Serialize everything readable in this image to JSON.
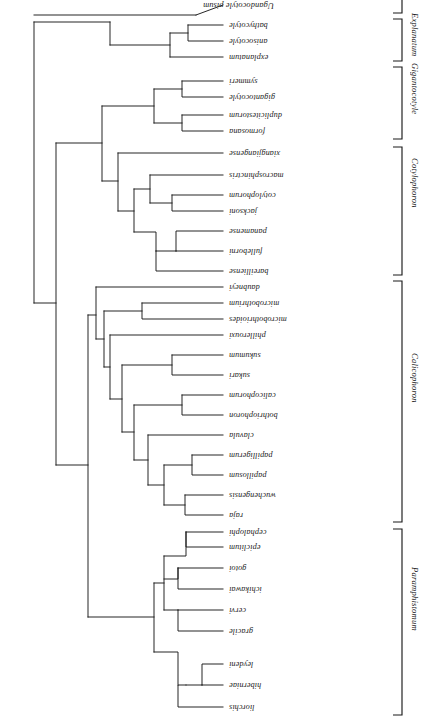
{
  "figure": {
    "type": "phylogenetic-cladogram",
    "orientation": "rotated-180",
    "root_label": "Ugandocotyle pisum",
    "genus_groups": [
      {
        "name": "Paramphistomum",
        "taxa": [
          "liorchis",
          "hiberniae",
          "leydeni",
          "gracile",
          "cervi",
          "ichikawai",
          "gotoi",
          "epiclitum",
          "cephalophi"
        ]
      },
      {
        "name": "Calicophoron",
        "taxa": [
          "raja",
          "wuchengensis",
          "papillosum",
          "papilligerum",
          "clavula",
          "bothriophoron",
          "calicophorum",
          "sukari",
          "sukumum",
          "phillerouxi",
          "microbothrioides",
          "microbothrium",
          "daubneyi"
        ]
      },
      {
        "name": "Cotylophoron",
        "taxa": [
          "bareilliense",
          "fulleborni",
          "panamense",
          "jacksoni",
          "cotylophorum",
          "macrosphinctris",
          "xiangjiangense"
        ]
      },
      {
        "name": "Gigantocotyle",
        "taxa": [
          "formosana",
          "duplicitestorum",
          "gigantocotyle",
          "symmeri"
        ]
      },
      {
        "name": "Explanatum",
        "taxa": [
          "explanatum",
          "anisocotyle",
          "bathycotyle"
        ]
      }
    ]
  },
  "taxa": [
    {
      "id": "liorchis",
      "label": "liorchis"
    },
    {
      "id": "hiberniae",
      "label": "hiberniae"
    },
    {
      "id": "leydeni",
      "label": "leydeni"
    },
    {
      "id": "gracile",
      "label": "gracile"
    },
    {
      "id": "cervi",
      "label": "cervi"
    },
    {
      "id": "ichikawai",
      "label": "ichikawai"
    },
    {
      "id": "gotoi",
      "label": "gotoi"
    },
    {
      "id": "epiclitum",
      "label": "epiclitum"
    },
    {
      "id": "cephalophi",
      "label": "cephalophi"
    },
    {
      "id": "raja",
      "label": "raja"
    },
    {
      "id": "wuchengensis",
      "label": "wuchengensis"
    },
    {
      "id": "papillosum",
      "label": "papillosum"
    },
    {
      "id": "papilligerum",
      "label": "papilligerum"
    },
    {
      "id": "clavula",
      "label": "clavula"
    },
    {
      "id": "bothriophoron",
      "label": "bothriophoron"
    },
    {
      "id": "calicophorum",
      "label": "calicophorum"
    },
    {
      "id": "sukari",
      "label": "sukari"
    },
    {
      "id": "sukumum",
      "label": "sukumum"
    },
    {
      "id": "phillerouxi",
      "label": "phillerouxi"
    },
    {
      "id": "microbothrioides",
      "label": "microbothrioides"
    },
    {
      "id": "microbothrium",
      "label": "microbothrium"
    },
    {
      "id": "daubneyi",
      "label": "daubneyi"
    },
    {
      "id": "bareilliense",
      "label": "bareilliense"
    },
    {
      "id": "fulleborni",
      "label": "fulleborni"
    },
    {
      "id": "panamense",
      "label": "panamense"
    },
    {
      "id": "jacksoni",
      "label": "jacksoni"
    },
    {
      "id": "cotylophorum",
      "label": "cotylophorum"
    },
    {
      "id": "macrosphinctris",
      "label": "macrosphinctris"
    },
    {
      "id": "xiangjiangense",
      "label": "xiangjiangense"
    },
    {
      "id": "formosana",
      "label": "formosana"
    },
    {
      "id": "duplicitestorum",
      "label": "duplicitestorum"
    },
    {
      "id": "gigantocotyle",
      "label": "gigantocotyle"
    },
    {
      "id": "symmeri",
      "label": "symmeri"
    },
    {
      "id": "explanatum",
      "label": "explanatum"
    },
    {
      "id": "anisocotyle",
      "label": "anisocotyle"
    },
    {
      "id": "bathycotyle",
      "label": "bathycotyle"
    },
    {
      "id": "ugandocotyle",
      "label": "Ugandocotyle pisum"
    }
  ],
  "genus_brackets": [
    {
      "id": "paramphistomum",
      "label": "Paramphistomum"
    },
    {
      "id": "calicophoron",
      "label": "Calicophoron"
    },
    {
      "id": "cotylophoron",
      "label": "Cotylophoron"
    },
    {
      "id": "gigantocotyle",
      "label": "Gigantocotyle"
    },
    {
      "id": "explanatum",
      "label": "Explanatum"
    }
  ],
  "colors": {
    "ink": "#1a1a1a",
    "background": "#ffffff"
  }
}
